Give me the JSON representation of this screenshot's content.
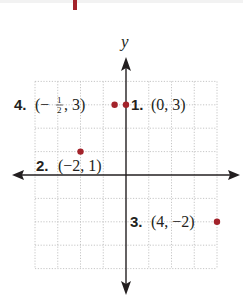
{
  "chart_data": {
    "type": "scatter",
    "title": "",
    "xlabel": "",
    "ylabel": "y",
    "xlim": [
      -4,
      4
    ],
    "ylim": [
      -4,
      4
    ],
    "grid": true,
    "axes_with_arrows": true,
    "points": [
      {
        "id": 1,
        "label": "1.",
        "coord_text": "(0, 3)",
        "x": 0,
        "y": 3
      },
      {
        "id": 2,
        "label": "2.",
        "coord_text": "(−2, 1)",
        "x": -2,
        "y": 1
      },
      {
        "id": 3,
        "label": "3.",
        "coord_text": "(4, −2)",
        "x": 4,
        "y": -2
      },
      {
        "id": 4,
        "label": "4.",
        "coord_text": "(−1/2, 3)",
        "x": -0.5,
        "y": 3
      }
    ],
    "point_color": "#a3232b",
    "axis_color": "#231f20"
  },
  "labels": {
    "y_axis": "y",
    "p1_num": "1.",
    "p1_coord": "(0, 3)",
    "p2_num": "2.",
    "p2_coord": "(−2, 1)",
    "p3_num": "3.",
    "p3_coord": "(4, −2)",
    "p4_num": "4.",
    "p4_open": "(−",
    "p4_frac_num": "1",
    "p4_frac_den": "2",
    "p4_close": ", 3)"
  }
}
